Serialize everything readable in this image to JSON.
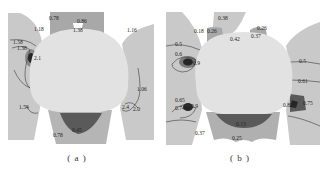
{
  "figure": {
    "panels": [
      {
        "id": "a",
        "caption": "( a )",
        "contour_labels": [
          "0.78",
          "0.86",
          "1.18",
          "1.38",
          "1.16",
          "1.58",
          "1.38",
          "2.1",
          "1.54",
          "1.06",
          "2.4",
          "2.0",
          "0.45",
          "0.78"
        ]
      },
      {
        "id": "b",
        "caption": "( b )",
        "contour_labels": [
          "0.38",
          "0.18",
          "0.26",
          "0.42",
          "0.26",
          "0.37",
          "0.5",
          "0.6",
          "0.9",
          "0.5",
          "0.61",
          "0.65",
          "0.74",
          "0.9",
          "0.82",
          "0.75",
          "0.37",
          "0.13",
          "0.25"
        ]
      }
    ],
    "colors": {
      "background_region": "#c9c9c9",
      "light_region": "#d6d6d6",
      "opening": "#e2e2e2",
      "mid_region": "#a8a8a8",
      "dark_region": "#5a5a5a",
      "darkest_region": "#262626",
      "contour_line": "#3a3a3a"
    }
  }
}
